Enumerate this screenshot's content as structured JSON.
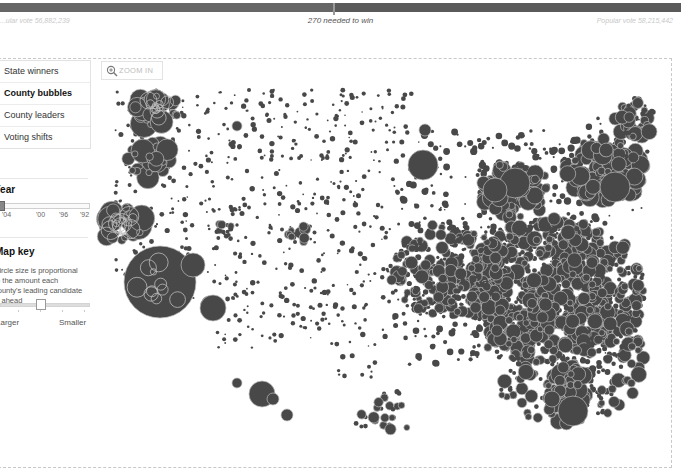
{
  "header": {
    "left_label": "...ular vote 56,882,239",
    "center_label": "270 needed to win",
    "right_label": "Popular vote 58,215,442"
  },
  "views": {
    "items": [
      {
        "label": "State winners",
        "active": false
      },
      {
        "label": "County bubbles",
        "active": true
      },
      {
        "label": "County leaders",
        "active": false
      },
      {
        "label": "Voting shifts",
        "active": false
      }
    ]
  },
  "year": {
    "title": "Year",
    "ticks": [
      "'04",
      "'00",
      "'96",
      "'92"
    ],
    "selected_index": 0
  },
  "map_key": {
    "title": "Map key",
    "description": "Circle size is proportional to the amount each county's leading candidate is ahead",
    "left_label": "Larger",
    "right_label": "Smaller"
  },
  "map": {
    "zoom_label": "ZOOM IN",
    "bubble_color": "#484848",
    "outline_color": "#bdbdbd",
    "clusters": [
      {
        "x": 62,
        "y": 50,
        "r": 22,
        "n": 40,
        "rmin": 3,
        "rmax": 14
      },
      {
        "x": 55,
        "y": 100,
        "r": 22,
        "n": 40,
        "rmin": 3,
        "rmax": 12
      },
      {
        "x": 28,
        "y": 165,
        "r": 22,
        "n": 30,
        "rmin": 3,
        "rmax": 14
      },
      {
        "x": 55,
        "y": 222,
        "r": 28,
        "n": 12,
        "rmin": 4,
        "rmax": 12
      },
      {
        "x": 130,
        "y": 170,
        "r": 10,
        "n": 10,
        "rmin": 2,
        "rmax": 6
      },
      {
        "x": 205,
        "y": 175,
        "r": 12,
        "n": 14,
        "rmin": 2,
        "rmax": 6
      },
      {
        "x": 115,
        "y": 250,
        "r": 10,
        "n": 4,
        "rmin": 3,
        "rmax": 8
      },
      {
        "x": 420,
        "y": 130,
        "r": 35,
        "n": 120,
        "rmin": 2,
        "rmax": 10
      },
      {
        "x": 510,
        "y": 110,
        "r": 40,
        "n": 160,
        "rmin": 2,
        "rmax": 10
      },
      {
        "x": 460,
        "y": 230,
        "r": 90,
        "n": 700,
        "rmin": 2,
        "rmax": 8
      },
      {
        "x": 355,
        "y": 210,
        "r": 60,
        "n": 300,
        "rmin": 1.5,
        "rmax": 7
      },
      {
        "x": 470,
        "y": 300,
        "r": 80,
        "n": 250,
        "rmin": 2,
        "rmax": 8
      },
      {
        "x": 470,
        "y": 320,
        "r": 20,
        "n": 30,
        "rmin": 3,
        "rmax": 12
      },
      {
        "x": 300,
        "y": 350,
        "r": 25,
        "n": 20,
        "rmin": 2,
        "rmax": 6
      },
      {
        "x": 270,
        "y": 360,
        "r": 10,
        "n": 8,
        "rmin": 2,
        "rmax": 6
      },
      {
        "x": 540,
        "y": 60,
        "r": 22,
        "n": 50,
        "rmin": 2,
        "rmax": 8
      }
    ],
    "singles": [
      {
        "x": 65,
        "y": 222,
        "r": 36
      },
      {
        "x": 98,
        "y": 205,
        "r": 12
      },
      {
        "x": 118,
        "y": 248,
        "r": 13
      },
      {
        "x": 167,
        "y": 334,
        "r": 13
      },
      {
        "x": 178,
        "y": 339,
        "r": 6
      },
      {
        "x": 192,
        "y": 355,
        "r": 6
      },
      {
        "x": 142,
        "y": 323,
        "r": 5
      },
      {
        "x": 478,
        "y": 351,
        "r": 15
      },
      {
        "x": 457,
        "y": 339,
        "r": 8
      },
      {
        "x": 330,
        "y": 70,
        "r": 6
      },
      {
        "x": 328,
        "y": 105,
        "r": 15
      },
      {
        "x": 420,
        "y": 123,
        "r": 15
      },
      {
        "x": 520,
        "y": 127,
        "r": 15
      },
      {
        "x": 400,
        "y": 130,
        "r": 12
      },
      {
        "x": 142,
        "y": 66,
        "r": 5
      }
    ]
  }
}
